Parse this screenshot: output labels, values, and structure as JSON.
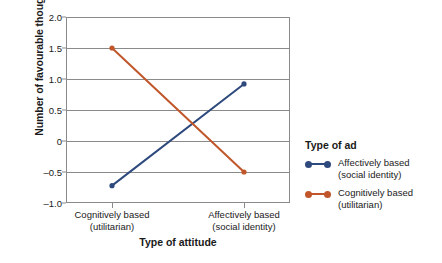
{
  "chart_data": {
    "type": "line",
    "title": "",
    "xlabel": "Type of attitude",
    "ylabel": "Number of favourable thoughts",
    "categories": [
      "Cognitively based (utilitarian)",
      "Affectively based (social identity)"
    ],
    "category_lines": [
      [
        "Cognitively based",
        "(utilitarian)"
      ],
      [
        "Affectively based",
        "(social identity)"
      ]
    ],
    "ylim": [
      -1.0,
      2.0
    ],
    "yticks": [
      2.0,
      1.5,
      1.0,
      0.5,
      0,
      -0.5,
      -1.0
    ],
    "ytick_labels": [
      "2.0",
      "1.5",
      "1.0",
      "0.5",
      "0",
      "–0.5",
      "–1.0"
    ],
    "grid": true,
    "legend_position": "right",
    "legend_title": "Type of ad",
    "series": [
      {
        "name": "Affectively based (social identity)",
        "name_lines": [
          "Affectively based",
          "(social identity)"
        ],
        "color": "#2e4a7d",
        "values": [
          -0.72,
          0.92
        ]
      },
      {
        "name": "Cognitively based (utilitarian)",
        "name_lines": [
          "Cognitively based",
          "(utilitarian)"
        ],
        "color": "#c0562a",
        "values": [
          1.5,
          -0.5
        ]
      }
    ]
  },
  "axis": {
    "y_title": "Number of favourable thoughts",
    "x_title": "Type of attitude"
  },
  "legend": {
    "title": "Type of ad",
    "entries": [
      {
        "line1": "Affectively based",
        "line2": "(social identity)",
        "color": "#2e4a7d"
      },
      {
        "line1": "Cognitively based",
        "line2": "(utilitarian)",
        "color": "#c0562a"
      }
    ]
  },
  "colors": {
    "series_blue": "#2e4a7d",
    "series_orange": "#c0562a",
    "axis": "#8a8a8a",
    "text": "#1a1a1a",
    "background": "#ffffff"
  }
}
